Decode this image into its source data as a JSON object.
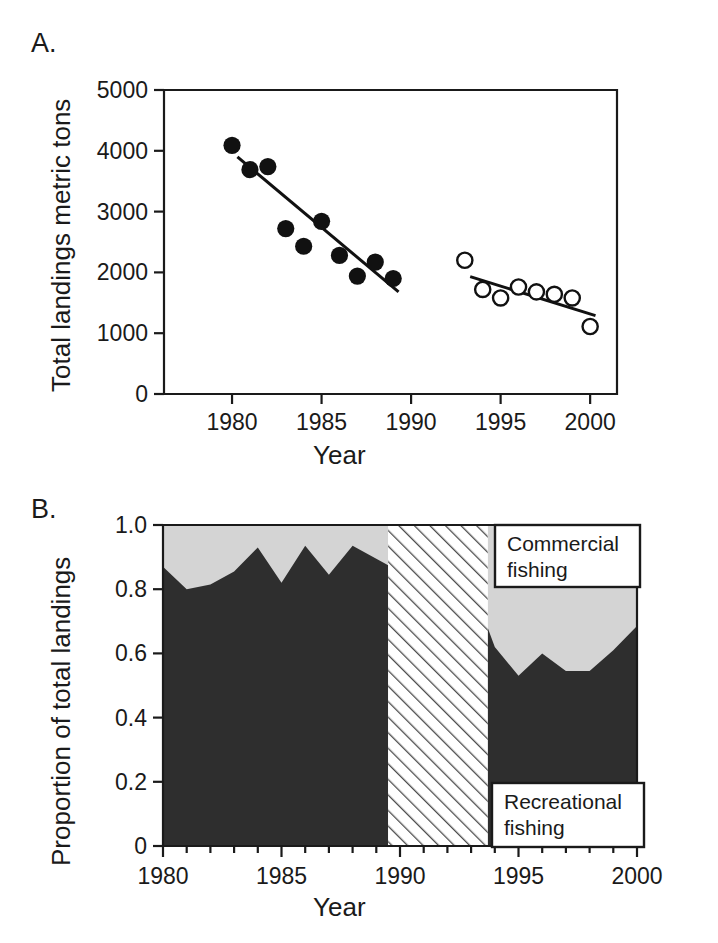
{
  "figure": {
    "panel_a_label": "A.",
    "panel_b_label": "B."
  },
  "panel_a": {
    "y_axis_title": "Total landings metric tons",
    "x_axis_title": "Year",
    "y_ticks": [
      "0",
      "1000",
      "2000",
      "3000",
      "4000",
      "5000"
    ],
    "x_ticks": [
      "1980",
      "1985",
      "1990",
      "1995",
      "2000"
    ]
  },
  "panel_b": {
    "y_axis_title": "Proportion of total landings",
    "x_axis_title": "Year",
    "y_ticks": [
      "0",
      "0.2",
      "0.4",
      "0.6",
      "0.8",
      "1.0"
    ],
    "x_ticks": [
      "1980",
      "1985",
      "1990",
      "1995",
      "2000"
    ],
    "legend_commercial_line1": "Commercial",
    "legend_commercial_line2": "fishing",
    "legend_recreational_line1": "Recreational",
    "legend_recreational_line2": "fishing"
  },
  "colors": {
    "axis": "#1a1a1a",
    "text": "#1a1a1a",
    "filled_marker": "#111111",
    "open_marker_stroke": "#111111",
    "open_marker_fill": "#ffffff",
    "trend_line": "#111111",
    "recreational_fill": "#2e2e2e",
    "commercial_fill": "#d4d4d4",
    "hatch_stroke": "#4a4a4a",
    "legend_box_fill": "#ffffff",
    "legend_box_stroke": "#1a1a1a",
    "plot_background": "#ffffff"
  },
  "chart_data": [
    {
      "type": "scatter",
      "panel": "A",
      "title": "",
      "xlabel": "Year",
      "ylabel": "Total landings metric tons",
      "xlim": [
        1976.2,
        2001.5
      ],
      "ylim": [
        0,
        5000
      ],
      "grid": false,
      "legend_position": "none",
      "yticks": [
        0,
        1000,
        2000,
        3000,
        4000,
        5000
      ],
      "xticks": [
        1980,
        1985,
        1990,
        1995,
        2000
      ],
      "series": [
        {
          "name": "Historical period (filled circles)",
          "marker": "filled-circle",
          "x": [
            1980,
            1981,
            1982,
            1983,
            1984,
            1985,
            1986,
            1987,
            1988,
            1989
          ],
          "y": [
            4090,
            3690,
            3740,
            2720,
            2430,
            2840,
            2280,
            1940,
            2170,
            1900
          ]
        },
        {
          "name": "Recent period (open circles)",
          "marker": "open-circle",
          "x": [
            1993,
            1994,
            1995,
            1996,
            1997,
            1998,
            1999,
            2000
          ],
          "y": [
            2200,
            1720,
            1580,
            1760,
            1680,
            1640,
            1580,
            1110
          ]
        }
      ],
      "trend_lines": [
        {
          "name": "Historical regression",
          "x": [
            1980.3,
            1989.3
          ],
          "y": [
            3900,
            1680
          ]
        },
        {
          "name": "Recent regression",
          "x": [
            1993.3,
            2000.3
          ],
          "y": [
            1930,
            1290
          ]
        }
      ]
    },
    {
      "type": "area",
      "panel": "B",
      "title": "",
      "xlabel": "Year",
      "ylabel": "Proportion of total landings",
      "xlim": [
        1980,
        2000
      ],
      "ylim": [
        0,
        1.0
      ],
      "grid": false,
      "stacked": true,
      "legend_position": "inside-right",
      "yticks": [
        0,
        0.2,
        0.4,
        0.6,
        0.8,
        1.0
      ],
      "xticks": [
        1980,
        1985,
        1990,
        1995,
        2000
      ],
      "no_data_gap": {
        "label": "no data (hatched)",
        "x_start": 1989.5,
        "x_end": 1993.7
      },
      "segments": [
        {
          "name": "1980-1989",
          "x": [
            1980,
            1981,
            1982,
            1983,
            1984,
            1985,
            1986,
            1987,
            1988,
            1989.5
          ],
          "series": [
            {
              "name": "Recreational fishing",
              "values": [
                0.87,
                0.8,
                0.815,
                0.855,
                0.93,
                0.82,
                0.935,
                0.845,
                0.935,
                0.875
              ]
            },
            {
              "name": "Commercial fishing",
              "values": [
                0.13,
                0.2,
                0.185,
                0.145,
                0.07,
                0.18,
                0.065,
                0.155,
                0.065,
                0.125
              ]
            }
          ]
        },
        {
          "name": "1993-2000",
          "x": [
            1993.7,
            1994,
            1995,
            1996,
            1997,
            1998,
            1999,
            2000
          ],
          "series": [
            {
              "name": "Recreational fishing",
              "values": [
                0.68,
                0.62,
                0.53,
                0.6,
                0.545,
                0.545,
                0.61,
                0.685
              ]
            },
            {
              "name": "Commercial fishing",
              "values": [
                0.32,
                0.38,
                0.47,
                0.4,
                0.455,
                0.455,
                0.39,
                0.315
              ]
            }
          ]
        }
      ]
    }
  ]
}
